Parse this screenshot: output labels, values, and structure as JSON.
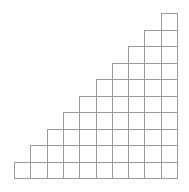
{
  "diagram": {
    "type": "staircase-grid",
    "columns": 10,
    "rows": 10,
    "column_heights": [
      1,
      2,
      3,
      4,
      5,
      6,
      7,
      8,
      9,
      10
    ],
    "origin_x": 14,
    "bottom_y": 178,
    "cell_width": 16.3,
    "cell_height": 16.5,
    "line_color": "#9a9a9a",
    "background": "#ffffff"
  }
}
